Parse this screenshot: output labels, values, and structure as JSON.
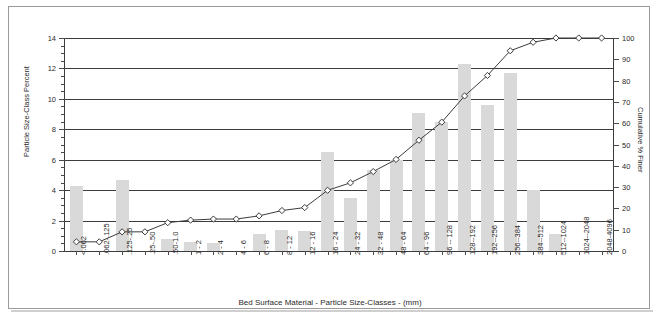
{
  "chart_data": {
    "type": "bar",
    "title": "",
    "xlabel": "Bed Surface Material  -  Particle Size-Classes  - (mm)",
    "ylabel": "Particle Size-Class Percent",
    "y2label": "Cumulative % Finer",
    "ylim": [
      0,
      14
    ],
    "y2lim": [
      0,
      100
    ],
    "yticks": [
      0,
      2,
      4,
      6,
      8,
      10,
      12,
      14
    ],
    "y2ticks": [
      0,
      10,
      20,
      30,
      40,
      50,
      60,
      70,
      80,
      90,
      100
    ],
    "grid": true,
    "legend": "none",
    "categories": [
      "<.062",
      ".062-.125",
      ".125-.25",
      ".25-.50",
      ".50-1.0",
      "1  -  2",
      "2  -  4",
      "4  -  6",
      "6  -  8",
      "8  -  12",
      "12  -  16",
      "16  -  24",
      "24  -  32",
      "32  -  48",
      "48  -  64",
      "64  -  96",
      "96  --  128",
      "128--192",
      "192--256",
      "256--384",
      "384--512",
      "512--1024",
      "1024--2048",
      "2048-4096"
    ],
    "series": [
      {
        "name": "Particle Size-Class Percent",
        "axis": "left",
        "type": "bar",
        "color": "#d9d9d9",
        "values": [
          4.3,
          0.0,
          4.7,
          0.0,
          0.8,
          0.6,
          0.5,
          0.0,
          1.1,
          1.4,
          1.3,
          6.5,
          3.5,
          5.3,
          6.0,
          9.1,
          8.5,
          12.3,
          9.6,
          11.7,
          4.0,
          1.1,
          0.0,
          0.0
        ]
      },
      {
        "name": "Cumulative % Finer",
        "axis": "right",
        "type": "line",
        "color": "#3c3c3c",
        "marker": "diamond",
        "values": [
          4.3,
          4.3,
          9.0,
          9.0,
          13.3,
          14.5,
          15.0,
          15.0,
          16.5,
          19.0,
          20.4,
          28.5,
          32.0,
          37.3,
          43.0,
          52.0,
          60.5,
          72.8,
          82.4,
          94.0,
          98.0,
          100.0,
          100.0,
          100.0
        ]
      }
    ]
  },
  "axis_titles": {
    "left": "Particle Size-Class Percent",
    "right": "Cumulative % Finer",
    "bottom": "Bed Surface Material  -  Particle Size-Classes  - (mm)"
  }
}
